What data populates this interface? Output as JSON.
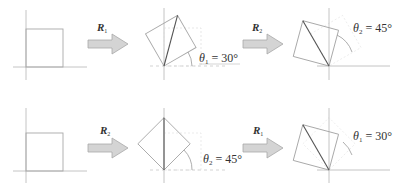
{
  "rows": [
    {
      "id": "row-1",
      "steps": [
        {
          "arrow_label": "R",
          "arrow_sub": "1"
        },
        {
          "arrow_label": "R",
          "arrow_sub": "2"
        }
      ],
      "angles": [
        {
          "symbol": "θ",
          "sub": "1",
          "text": " = 30°"
        },
        {
          "symbol": "θ",
          "sub": "2",
          "text": " = 45°"
        }
      ]
    },
    {
      "id": "row-2",
      "steps": [
        {
          "arrow_label": "R",
          "arrow_sub": "2"
        },
        {
          "arrow_label": "R",
          "arrow_sub": "1"
        }
      ],
      "angles": [
        {
          "symbol": "θ",
          "sub": "2",
          "text": " = 45°"
        },
        {
          "symbol": "θ",
          "sub": "1",
          "text": " = 30°"
        }
      ]
    }
  ],
  "colors": {
    "square": "#a8a8a8",
    "axis": "#b5b5b5",
    "diagonal": "#555555",
    "arrow_fill": "#d0d0d0",
    "arrow_stroke": "#a0a0a0",
    "text": "#333333"
  }
}
